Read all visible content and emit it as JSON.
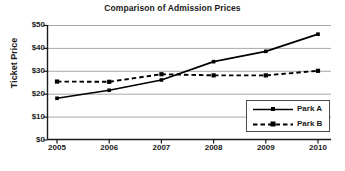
{
  "chart_data": {
    "type": "line",
    "title": "Comparison of Admission Prices",
    "xlabel": "",
    "ylabel": "Ticket Price",
    "categories": [
      "2005",
      "2006",
      "2007",
      "2008",
      "2009",
      "2010"
    ],
    "x": [
      2005,
      2006,
      2007,
      2008,
      2009,
      2010
    ],
    "xlim": [
      2005,
      2010
    ],
    "ylim": [
      0,
      50
    ],
    "yticks": [
      0,
      10,
      20,
      30,
      40,
      50
    ],
    "ytick_labels": [
      "$0",
      "$10",
      "$20",
      "$30",
      "$40",
      "$50"
    ],
    "xtick_labels": [
      "2005",
      "2006",
      "2007",
      "2008",
      "2009",
      "2010"
    ],
    "grid": "horizontal",
    "legend_position": "bottom-right",
    "series": [
      {
        "name": "Park A",
        "values": [
          18,
          21.5,
          26,
          34,
          38.5,
          46
        ],
        "line_style": "solid",
        "color": "#000000",
        "marker": "square"
      },
      {
        "name": "Park B",
        "values": [
          25.3,
          25.2,
          28.5,
          28,
          28,
          30
        ],
        "line_style": "dashed",
        "color": "#000000",
        "marker": "square"
      }
    ]
  },
  "legend": {
    "items": [
      {
        "label": "Park A"
      },
      {
        "label": "Park B"
      }
    ]
  },
  "colors": {
    "axis": "#1a1a1a",
    "grid": "#a8a8a8",
    "line": "#000000",
    "background": "#ffffff",
    "legend_border": "#4a4a4a"
  }
}
